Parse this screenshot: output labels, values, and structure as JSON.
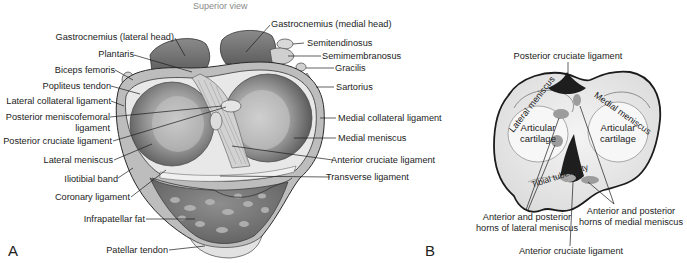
{
  "figure": {
    "panel_a": {
      "letter": "A",
      "view_caption": "Superior view",
      "labels_left": [
        {
          "id": "gastroc-lat",
          "text": "Gastrocnemius (lateral head)"
        },
        {
          "id": "plantaris",
          "text": "Plantaris"
        },
        {
          "id": "biceps",
          "text": "Biceps femoris"
        },
        {
          "id": "popliteus",
          "text": "Popliteus tendon"
        },
        {
          "id": "lcl",
          "text": "Lateral collateral ligament"
        },
        {
          "id": "pmfl-1",
          "text": "Posterior meniscofemoral"
        },
        {
          "id": "pmfl-2",
          "text": "ligament"
        },
        {
          "id": "pcl",
          "text": "Posterior cruciate ligament"
        },
        {
          "id": "lat-men",
          "text": "Lateral meniscus"
        },
        {
          "id": "itb",
          "text": "Iliotibial band"
        },
        {
          "id": "coronary",
          "text": "Coronary ligament"
        },
        {
          "id": "infrapat",
          "text": "Infrapatellar fat"
        },
        {
          "id": "pat-tendon",
          "text": "Patellar tendon"
        }
      ],
      "labels_right": [
        {
          "id": "gastroc-med",
          "text": "Gastrocnemius (medial head)"
        },
        {
          "id": "semitend",
          "text": "Semitendinosus"
        },
        {
          "id": "semimem",
          "text": "Semimembranosus"
        },
        {
          "id": "gracilis",
          "text": "Gracilis"
        },
        {
          "id": "sartorius",
          "text": "Sartorius"
        },
        {
          "id": "mcl",
          "text": "Medial collateral ligament"
        },
        {
          "id": "med-men",
          "text": "Medial meniscus"
        },
        {
          "id": "acl",
          "text": "Anterior cruciate ligament"
        },
        {
          "id": "transverse",
          "text": "Transverse ligament"
        }
      ]
    },
    "panel_b": {
      "letter": "B",
      "inner_labels": {
        "lateral_meniscus": "Lateral meniscus",
        "medial_meniscus": "Medial meniscus",
        "articular_left": "Articular\ncartilage",
        "articular_right": "Articular\ncartilage",
        "tibial_tuberosity": "Tibial tuberosity"
      },
      "callouts": {
        "pcl": "Posterior cruciate ligament",
        "lat_horns_1": "Anterior and posterior",
        "lat_horns_2": "horns of lateral meniscus",
        "med_horns_1": "Anterior and posterior",
        "med_horns_2": "horns of medial meniscus",
        "acl": "Anterior cruciate ligament"
      }
    },
    "colors": {
      "ink": "#1c1c1c",
      "caption_gray": "#8a8a8a",
      "tissue_dark": "#6e6e6e",
      "tissue_mid": "#9a9a9a",
      "tissue_light": "#c8c8c8",
      "cartilage": "#e6e6e6",
      "ligament_black": "#1e1e1e"
    }
  }
}
